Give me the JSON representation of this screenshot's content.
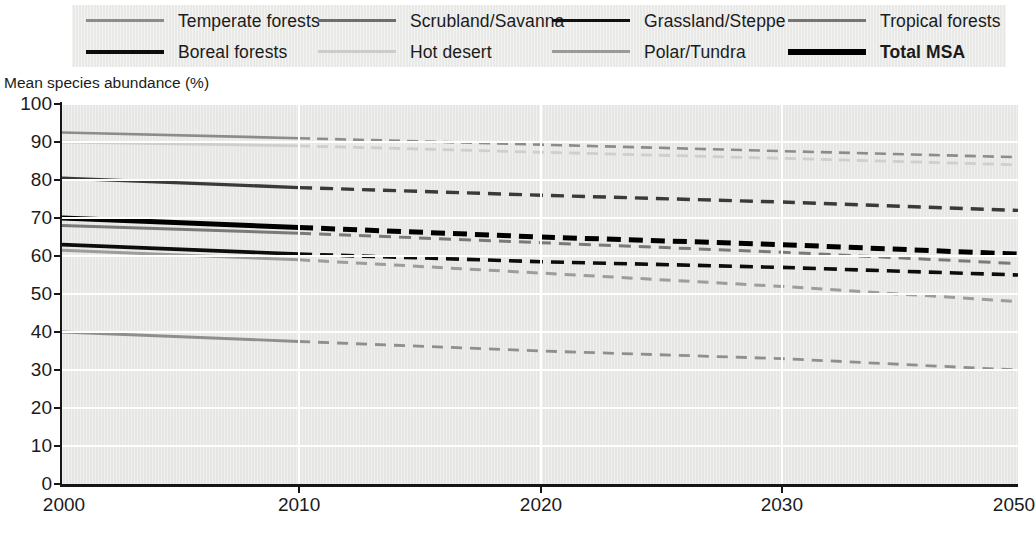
{
  "axis_title": "Mean species abundance (%)",
  "legend": {
    "rows": [
      [
        {
          "label": "Temperate forests",
          "color": "#8c8c8c",
          "width": 3.0,
          "bold": false,
          "name": "legend-temperate-forests"
        },
        {
          "label": "Scrubland/Savanna",
          "color": "#6e6e6e",
          "width": 3.0,
          "bold": false,
          "name": "legend-scrubland-savanna"
        },
        {
          "label": "Grassland/Steppe",
          "color": "#111111",
          "width": 3.6,
          "bold": false,
          "name": "legend-grassland-steppe"
        },
        {
          "label": "Tropical forests",
          "color": "#757575",
          "width": 3.4,
          "bold": false,
          "name": "legend-tropical-forests"
        }
      ],
      [
        {
          "label": "Boreal forests",
          "color": "#0d0d0d",
          "width": 4.2,
          "bold": false,
          "name": "legend-boreal-forests"
        },
        {
          "label": "Hot desert",
          "color": "#cccccc",
          "width": 3.0,
          "bold": false,
          "name": "legend-hot-desert"
        },
        {
          "label": "Polar/Tundra",
          "color": "#9a9a9a",
          "width": 3.0,
          "bold": false,
          "name": "legend-polar-tundra"
        },
        {
          "label": "Total MSA",
          "color": "#000000",
          "width": 6.0,
          "bold": true,
          "name": "legend-total-msa"
        }
      ]
    ]
  },
  "chart_data": {
    "type": "line",
    "title": "",
    "xlabel": "",
    "ylabel": "Mean species abundance (%)",
    "ylim": [
      0,
      100
    ],
    "ytick_labels": [
      "0",
      "10",
      "20",
      "30",
      "40",
      "50",
      "60",
      "70",
      "80",
      "90",
      "100"
    ],
    "yticks": [
      0,
      10,
      20,
      30,
      40,
      50,
      60,
      70,
      80,
      90,
      100
    ],
    "xtick_labels": [
      "2000",
      "2010",
      "2020",
      "2030",
      "2050"
    ],
    "xticks": [
      2000,
      2010,
      2020,
      2030,
      2050
    ],
    "x_axis_note": "non-linear: 2030 to 2050 compressed into one equal interval",
    "x_positions_frac": [
      0.0,
      0.248,
      0.501,
      0.753,
      1.0
    ],
    "grid": "horizontal-and-vertical-white",
    "legend_position": "top",
    "solid_until": 2010,
    "x": [
      2000,
      2010,
      2020,
      2030,
      2050
    ],
    "series": [
      {
        "name": "Temperate forests",
        "color": "#8c8c8c",
        "width": 2.6,
        "dash": "11,7",
        "values": [
          92.5,
          91.0,
          89.3,
          87.6,
          86.0
        ]
      },
      {
        "name": "Hot desert",
        "color": "#cfcfcf",
        "width": 2.8,
        "dash": "11,7",
        "values": [
          90.0,
          89.0,
          87.3,
          85.7,
          84.0
        ]
      },
      {
        "name": "Tropical forests",
        "color": "#3a3a3a",
        "width": 3.4,
        "dash": "13,8",
        "values": [
          80.5,
          78.0,
          76.0,
          74.2,
          72.0
        ]
      },
      {
        "name": "Total MSA",
        "color": "#000000",
        "width": 5.0,
        "dash": "14,8",
        "values": [
          70.0,
          67.5,
          65.0,
          63.0,
          60.5
        ]
      },
      {
        "name": "Grassland/Steppe",
        "color": "#7a7a7a",
        "width": 3.0,
        "dash": "12,8",
        "values": [
          68.0,
          66.0,
          63.5,
          61.0,
          58.0
        ]
      },
      {
        "name": "Boreal forests",
        "color": "#0d0d0d",
        "width": 3.6,
        "dash": "13,8",
        "values": [
          63.0,
          60.5,
          58.5,
          57.0,
          55.0
        ]
      },
      {
        "name": "Scrubland/Savanna",
        "color": "#9d9d9d",
        "width": 3.0,
        "dash": "11,8",
        "values": [
          61.5,
          59.0,
          55.5,
          52.0,
          48.0
        ]
      },
      {
        "name": "Polar/Tundra",
        "color": "#8f8f8f",
        "width": 2.8,
        "dash": "11,8",
        "values": [
          40.0,
          37.5,
          35.0,
          33.0,
          30.0
        ]
      }
    ]
  }
}
